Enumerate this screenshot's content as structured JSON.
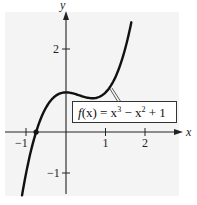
{
  "chart_data": {
    "type": "line",
    "title": "",
    "xlabel": "x",
    "ylabel": "y",
    "xlim": [
      -1.55,
      2.8
    ],
    "ylim": [
      -1.6,
      2.95
    ],
    "x_ticks": [
      -1,
      1,
      2
    ],
    "x_tick_labels": [
      "−1",
      "1",
      "2"
    ],
    "y_ticks": [
      2,
      -1
    ],
    "y_tick_labels": [
      "2",
      "−1"
    ],
    "grid": false,
    "series": [
      {
        "name": "f(x) = x^3 - x^2 + 1",
        "function": "x^3 - x^2 + 1",
        "x_range": [
          -1.11,
          1.65
        ],
        "x": [
          -1.1,
          -1.0,
          -0.755,
          -0.5,
          0,
          0.333,
          0.667,
          1.0,
          1.3,
          1.65
        ],
        "y": [
          -1.54,
          -1.0,
          0.0,
          0.625,
          1.0,
          0.926,
          0.852,
          1.0,
          1.507,
          2.77
        ]
      }
    ],
    "annotations": [
      {
        "type": "point",
        "x": -0.755,
        "y": 0,
        "label": "real root"
      },
      {
        "type": "label-box",
        "text": "f(x) = x³ − x² + 1",
        "points_to": [
          1.1,
          1.11
        ]
      }
    ]
  },
  "labels": {
    "x_axis": "x",
    "y_axis": "y",
    "x_tick_neg1": "−1",
    "x_tick_1": "1",
    "x_tick_2": "2",
    "y_tick_2": "2",
    "y_tick_neg1": "−1",
    "function_prefix": "f",
    "function_text": "(x) = x",
    "exp3": "3",
    "minus_x": " − x",
    "exp2": "2",
    "plus1": " + 1"
  },
  "colors": {
    "plot_bg": "#f4f4f4",
    "curve": "#111111",
    "axes": "#222222"
  }
}
